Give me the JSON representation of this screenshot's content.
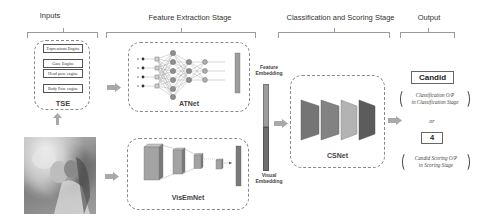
{
  "stages": {
    "inputs": "Inputs",
    "feature_extraction": "Feature Extraction Stage",
    "classification_scoring": "Classification and Scoring Stage",
    "output": "Output"
  },
  "tse": {
    "label": "TSE",
    "engines": [
      "Expressions Engine",
      "Gaze Engine",
      "Head pose engine",
      "Body Pose engine"
    ]
  },
  "input_image": {
    "description": "photo of a girl holding a small dog"
  },
  "networks": {
    "atnet": "ATNet",
    "visemnet": "VisEmNet",
    "csnet": "CSNet"
  },
  "embeddings": {
    "feature": [
      "Feature",
      "Embedding"
    ],
    "visual": [
      "Visual",
      "Embedding"
    ]
  },
  "output": {
    "class_value": "Candid",
    "class_note": [
      "Classification O/P",
      "in Classification Stage"
    ],
    "or_label": "or",
    "score_value": "4",
    "score_note": [
      "Candid Scoring O/P",
      "in Scoring Stage"
    ]
  },
  "colors": {
    "bar_light": "#9c9c9c",
    "bar_dark": "#6e6e6e",
    "arrow": "#a9a9a9",
    "dashed_border": "#8a8a8a"
  }
}
